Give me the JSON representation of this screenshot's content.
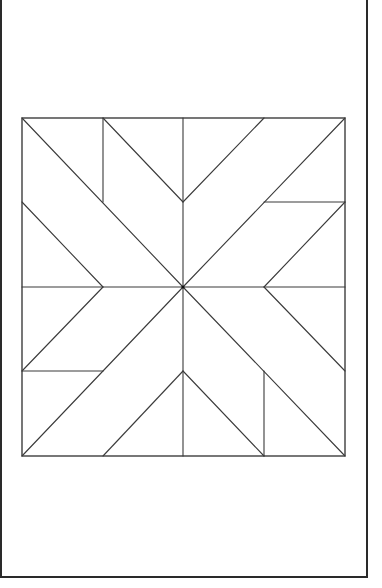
{
  "diagram": {
    "type": "quilt-block-pattern",
    "colors": {
      "background": "#ffffff",
      "line": "#3a3a3a",
      "border": "#2a2a2a"
    },
    "page_border": {
      "x": 1,
      "y": -4,
      "width": 366,
      "height": 581
    },
    "block": {
      "x": 22,
      "y": 118,
      "width": 323,
      "height": 338
    },
    "center": {
      "x": 183,
      "y": 287
    },
    "seams": [
      {
        "name": "center-vertical",
        "x1": 183,
        "y1": 118,
        "x2": 183,
        "y2": 456
      },
      {
        "name": "center-horizontal",
        "x1": 22,
        "y1": 287,
        "x2": 345,
        "y2": 287
      },
      {
        "name": "tl-main-diagonal",
        "x1": 22,
        "y1": 118,
        "x2": 183,
        "y2": 287
      },
      {
        "name": "tl-vertical",
        "x1": 103,
        "y1": 118,
        "x2": 103,
        "y2": 202
      },
      {
        "name": "tl-upper-diagonal",
        "x1": 103,
        "y1": 118,
        "x2": 183,
        "y2": 202
      },
      {
        "name": "tl-lower-diagonal",
        "x1": 22,
        "y1": 202,
        "x2": 103,
        "y2": 287
      },
      {
        "name": "tr-upper-diagonal",
        "x1": 264,
        "y1": 118,
        "x2": 183,
        "y2": 202
      },
      {
        "name": "tr-main-diagonal",
        "x1": 345,
        "y1": 118,
        "x2": 183,
        "y2": 287
      },
      {
        "name": "tr-horizontal",
        "x1": 264,
        "y1": 202,
        "x2": 345,
        "y2": 202
      },
      {
        "name": "tr-lower-diagonal",
        "x1": 345,
        "y1": 202,
        "x2": 264,
        "y2": 287
      },
      {
        "name": "bl-upper-diagonal",
        "x1": 103,
        "y1": 287,
        "x2": 22,
        "y2": 371
      },
      {
        "name": "bl-main-diagonal",
        "x1": 183,
        "y1": 287,
        "x2": 22,
        "y2": 456
      },
      {
        "name": "bl-horizontal",
        "x1": 22,
        "y1": 371,
        "x2": 103,
        "y2": 371
      },
      {
        "name": "bl-lower-diagonal",
        "x1": 183,
        "y1": 371,
        "x2": 103,
        "y2": 456
      },
      {
        "name": "br-upper-diagonal",
        "x1": 264,
        "y1": 287,
        "x2": 345,
        "y2": 371
      },
      {
        "name": "br-main-diagonal",
        "x1": 183,
        "y1": 287,
        "x2": 345,
        "y2": 456
      },
      {
        "name": "br-vertical",
        "x1": 264,
        "y1": 371,
        "x2": 264,
        "y2": 456
      },
      {
        "name": "br-lower-diagonal",
        "x1": 183,
        "y1": 371,
        "x2": 264,
        "y2": 456
      }
    ]
  }
}
